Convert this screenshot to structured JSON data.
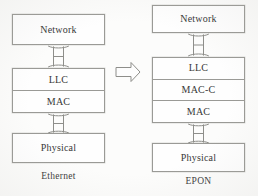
{
  "figure": {
    "background_color": "#fcfcfb",
    "line_color": "#9a9a96",
    "text_color": "#383838"
  },
  "left_stack": {
    "caption": "Ethernet",
    "layers": [
      {
        "label": "Network"
      },
      {
        "label": "LLC"
      },
      {
        "label": "MAC"
      },
      {
        "label": "Physical"
      }
    ],
    "connectors": [
      {
        "between": "Network-LLC",
        "type": "double-headed-arrow"
      },
      {
        "between": "MAC-Physical",
        "type": "double-headed-arrow"
      }
    ]
  },
  "transition": {
    "icon": "block-arrow-right",
    "direction": "right"
  },
  "right_stack": {
    "caption": "EPON",
    "layers": [
      {
        "label": "Network"
      },
      {
        "label": "LLC"
      },
      {
        "label": "MAC-C"
      },
      {
        "label": "MAC"
      },
      {
        "label": "Physical"
      }
    ],
    "connectors": [
      {
        "between": "Network-LLC",
        "type": "double-headed-arrow"
      },
      {
        "between": "MAC-Physical",
        "type": "double-headed-arrow"
      }
    ]
  }
}
